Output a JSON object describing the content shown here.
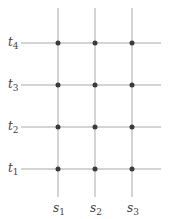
{
  "diagram": {
    "type": "grid-lattice",
    "colors": {
      "line": "#a9a9a9",
      "dot": "#3a3a3a",
      "text": "#444444"
    },
    "vertical_lines": [
      {
        "label": "s",
        "sub": "1",
        "x": 58
      },
      {
        "label": "s",
        "sub": "2",
        "x": 95
      },
      {
        "label": "s",
        "sub": "3",
        "x": 132
      }
    ],
    "horizontal_lines": [
      {
        "label": "t",
        "sub": "4",
        "y": 43
      },
      {
        "label": "t",
        "sub": "3",
        "y": 85
      },
      {
        "label": "t",
        "sub": "2",
        "y": 127
      },
      {
        "label": "t",
        "sub": "1",
        "y": 169
      }
    ],
    "vertical_extent": {
      "top": 8,
      "bottom": 197
    },
    "horizontal_extent": {
      "left": 21,
      "right": 161
    },
    "dot_radius": 2.5
  }
}
